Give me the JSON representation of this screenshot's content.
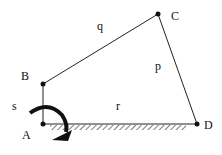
{
  "diagram": {
    "type": "four-bar linkage",
    "joints": [
      {
        "id": "A",
        "label": "A",
        "x": 43,
        "y": 124
      },
      {
        "id": "B",
        "label": "B",
        "x": 43,
        "y": 84
      },
      {
        "id": "C",
        "label": "C",
        "x": 158,
        "y": 14
      },
      {
        "id": "D",
        "label": "D",
        "x": 197,
        "y": 124
      }
    ],
    "links": [
      {
        "label": "s",
        "from": "A",
        "to": "B"
      },
      {
        "label": "q",
        "from": "B",
        "to": "C"
      },
      {
        "label": "p",
        "from": "C",
        "to": "D"
      },
      {
        "label": "r",
        "from": "A",
        "to": "D"
      }
    ],
    "rotation_arrow": "clockwise-input-arrow"
  }
}
